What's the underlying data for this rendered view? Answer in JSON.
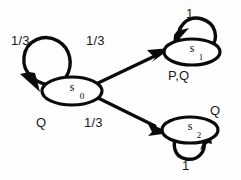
{
  "diagram": {
    "type": "markov-chain-state-transition-diagram",
    "colors": {
      "stroke": "#0a0a0a",
      "fill": "#ffffff",
      "background": "#fefefe"
    },
    "states": [
      {
        "id": "s0",
        "name": "s",
        "subscript": "0",
        "propositions": "Q"
      },
      {
        "id": "s1",
        "name": "s",
        "subscript": "1",
        "propositions": "P,Q"
      },
      {
        "id": "s2",
        "name": "s",
        "subscript": "2",
        "propositions": "Q"
      }
    ],
    "transitions": [
      {
        "from": "s0",
        "to": "s0",
        "probability": "1/3"
      },
      {
        "from": "s0",
        "to": "s1",
        "probability": "1/3"
      },
      {
        "from": "s0",
        "to": "s2",
        "probability": "1/3"
      },
      {
        "from": "s1",
        "to": "s1",
        "probability": "1"
      },
      {
        "from": "s2",
        "to": "s2",
        "probability": "1"
      }
    ]
  }
}
